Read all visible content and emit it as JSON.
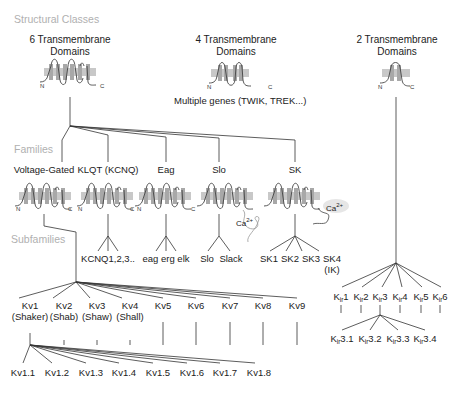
{
  "sections": {
    "structural": "Structural Classes",
    "families": "Families",
    "subfamilies": "Subfamilies"
  },
  "structural_classes": [
    {
      "line1": "6 Transmembrane",
      "line2": "Domains"
    },
    {
      "line1": "4 Transmembrane",
      "line2": "Domains",
      "note": "Multiple genes (TWIK, TREK...)"
    },
    {
      "line1": "2 Transmembrane",
      "line2": "Domains"
    }
  ],
  "terminal_labels": {
    "n": "N",
    "c": "C"
  },
  "families": [
    {
      "label": "Voltage-Gated"
    },
    {
      "label": "KLQT (KCNQ)",
      "members": "KCNQ1,2,3.."
    },
    {
      "label": "Eag",
      "members": "eag erg elk"
    },
    {
      "label": "Slo",
      "members_a": "Slo",
      "members_b": "Slack"
    },
    {
      "label": "SK",
      "members": [
        "SK1",
        "SK2",
        "SK3",
        "SK4"
      ],
      "sk4_note": "(IK)"
    }
  ],
  "calcium_label": {
    "base": "Ca",
    "sup": "2+"
  },
  "kv_subfamilies": [
    {
      "name": "Kv1",
      "alias": "(Shaker)"
    },
    {
      "name": "Kv2",
      "alias": "(Shab)"
    },
    {
      "name": "Kv3",
      "alias": "(Shaw)"
    },
    {
      "name": "Kv4",
      "alias": "(Shall)"
    },
    {
      "name": "Kv5"
    },
    {
      "name": "Kv6"
    },
    {
      "name": "Kv7"
    },
    {
      "name": "Kv8"
    },
    {
      "name": "Kv9"
    }
  ],
  "kv1_members": [
    "Kv1.1",
    "Kv1.2",
    "Kv1.3",
    "Kv1.4",
    "Kv1.5",
    "Kv1.6",
    "Kv1.7",
    "Kv1.8"
  ],
  "kir": {
    "prefix": "K",
    "sub": "ir",
    "subfamilies": [
      "1",
      "2",
      "3",
      "4",
      "5",
      "6"
    ],
    "kir3_members": [
      "3.1",
      "3.2",
      "3.3",
      "3.4"
    ]
  }
}
